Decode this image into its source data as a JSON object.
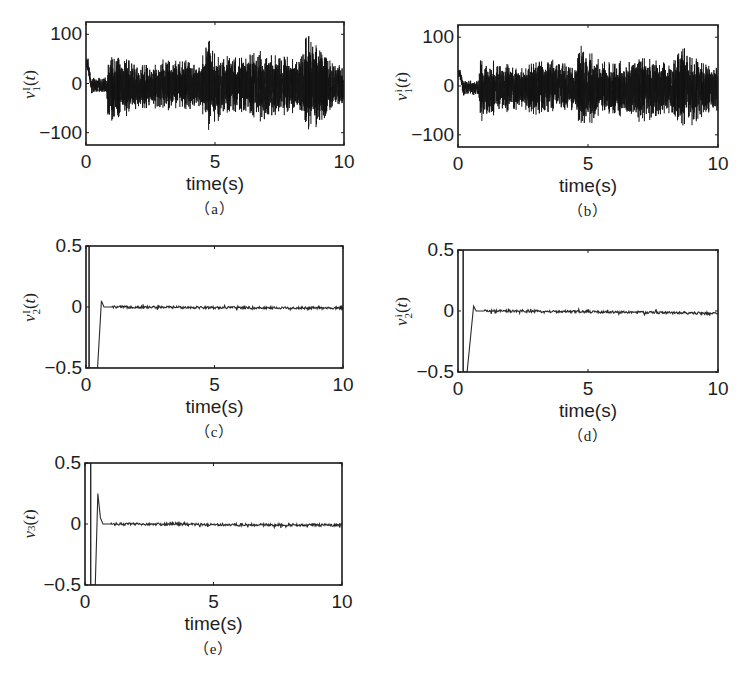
{
  "figure": {
    "panels": [
      {
        "id": "a",
        "caption": "（a）",
        "ylabel_base": "v",
        "ylabel_sup": "I",
        "ylabel_sub": "1",
        "ylabel_tail": "(t)",
        "xlabel": "time(s)",
        "yticks": [
          "100",
          "0",
          "−100"
        ],
        "xticks": [
          "0",
          "5",
          "10"
        ]
      },
      {
        "id": "b",
        "caption": "（b）",
        "ylabel_base": "v",
        "ylabel_sup": "i",
        "ylabel_sub": "1",
        "ylabel_tail": "(t)",
        "xlabel": "time(s)",
        "yticks": [
          "100",
          "0",
          "−100"
        ],
        "xticks": [
          "0",
          "5",
          "10"
        ]
      },
      {
        "id": "c",
        "caption": "（c）",
        "ylabel_base": "v",
        "ylabel_sup": "I",
        "ylabel_sub": "2",
        "ylabel_tail": "(t)",
        "xlabel": "time(s)",
        "yticks": [
          "0.5",
          "0",
          "−0.5"
        ],
        "xticks": [
          "0",
          "5",
          "10"
        ]
      },
      {
        "id": "d",
        "caption": "（d）",
        "ylabel_base": "v",
        "ylabel_sup": "i",
        "ylabel_sub": "2",
        "ylabel_tail": "(t)",
        "xlabel": "time(s)",
        "yticks": [
          "0.5",
          "0",
          "−0.5"
        ],
        "xticks": [
          "0",
          "5",
          "10"
        ]
      },
      {
        "id": "e",
        "caption": "（e）",
        "ylabel_base": "v",
        "ylabel_sup": "",
        "ylabel_sub": "3",
        "ylabel_tail": "(t)",
        "xlabel": "time(s)",
        "yticks": [
          "0.5",
          "0",
          "−0.5"
        ],
        "xticks": [
          "0",
          "5",
          "10"
        ]
      }
    ]
  },
  "chart_data": [
    {
      "panel": "a",
      "type": "line",
      "title": "",
      "xlabel": "time(s)",
      "ylabel": "v1^I(t)",
      "xlim": [
        0,
        10
      ],
      "ylim": [
        -125,
        125
      ],
      "xticks": [
        0,
        5,
        10
      ],
      "yticks": [
        -100,
        0,
        100
      ],
      "grid": false,
      "description": "Dense high-frequency control signal; initial ~50 at t=0, small amplitude (~±15) until t≈0.8, then broadband noise roughly ±50 with spikes to ~+100 near t=4.7 and t=8.6, and ~−95 near t=4.7.",
      "envelope": {
        "t": [
          0,
          0.1,
          0.2,
          0.3,
          0.8,
          0.85,
          1.5,
          2.5,
          3.0,
          3.8,
          4.5,
          4.7,
          5.0,
          5.5,
          6.0,
          6.8,
          7.5,
          8.2,
          8.6,
          9.0,
          9.5,
          10
        ],
        "upper": [
          55,
          50,
          10,
          12,
          12,
          55,
          50,
          35,
          50,
          45,
          48,
          100,
          60,
          55,
          50,
          65,
          60,
          50,
          100,
          70,
          45,
          30
        ],
        "lower": [
          30,
          20,
          -25,
          -20,
          -20,
          -75,
          -65,
          -45,
          -55,
          -50,
          -60,
          -95,
          -80,
          -60,
          -55,
          -75,
          -65,
          -55,
          -90,
          -85,
          -50,
          -40
        ]
      }
    },
    {
      "panel": "b",
      "type": "line",
      "title": "",
      "xlabel": "time(s)",
      "ylabel": "v1^i(t)",
      "xlim": [
        0,
        10
      ],
      "ylim": [
        -125,
        125
      ],
      "xticks": [
        0,
        5,
        10
      ],
      "yticks": [
        -100,
        0,
        100
      ],
      "grid": false,
      "description": "Dense high-frequency control signal similar to (a); initial ~35 at t=0, small amplitude until t≈0.8, then noise roughly ±50 with spikes ~+90 near t=4.8 and ~+80 near t=8.7, min ~−90 near t=4.8.",
      "envelope": {
        "t": [
          0,
          0.1,
          0.2,
          0.3,
          0.8,
          0.85,
          1.5,
          2.5,
          3.0,
          3.8,
          4.5,
          4.8,
          5.2,
          5.5,
          6.0,
          6.8,
          7.5,
          8.2,
          8.7,
          9.0,
          9.5,
          10
        ],
        "upper": [
          35,
          35,
          10,
          12,
          12,
          55,
          50,
          35,
          50,
          55,
          45,
          90,
          60,
          50,
          45,
          60,
          55,
          45,
          80,
          60,
          45,
          45
        ],
        "lower": [
          15,
          10,
          -25,
          -20,
          -20,
          -70,
          -60,
          -45,
          -60,
          -50,
          -55,
          -90,
          -70,
          -55,
          -55,
          -75,
          -70,
          -55,
          -80,
          -80,
          -55,
          -60
        ]
      }
    },
    {
      "panel": "c",
      "type": "line",
      "title": "",
      "xlabel": "time(s)",
      "ylabel": "v2^I(t)",
      "xlim": [
        0,
        10
      ],
      "ylim": [
        -0.5,
        0.5
      ],
      "xticks": [
        0,
        5,
        10
      ],
      "yticks": [
        -0.5,
        0,
        0.5
      ],
      "grid": false,
      "points": [
        [
          0.0,
          0.5
        ],
        [
          0.05,
          0.5
        ],
        [
          0.12,
          0.5
        ],
        [
          0.12,
          -0.5
        ],
        [
          0.45,
          -0.5
        ],
        [
          0.6,
          0.05
        ],
        [
          0.7,
          0.0
        ],
        [
          1.0,
          0.0
        ],
        [
          10,
          -0.01
        ]
      ],
      "noise_amplitude": 0.01
    },
    {
      "panel": "d",
      "type": "line",
      "title": "",
      "xlabel": "time(s)",
      "ylabel": "v2^i(t)",
      "xlim": [
        0,
        10
      ],
      "ylim": [
        -0.5,
        0.5
      ],
      "xticks": [
        0,
        5,
        10
      ],
      "yticks": [
        -0.5,
        0,
        0.5
      ],
      "grid": false,
      "points": [
        [
          0.0,
          0.5
        ],
        [
          0.08,
          0.5
        ],
        [
          0.2,
          0.5
        ],
        [
          0.2,
          -0.5
        ],
        [
          0.35,
          -0.5
        ],
        [
          0.6,
          0.04
        ],
        [
          0.7,
          0.0
        ],
        [
          1.0,
          0.0
        ],
        [
          6.8,
          -0.01
        ],
        [
          10,
          -0.02
        ]
      ],
      "noise_amplitude": 0.01
    },
    {
      "panel": "e",
      "type": "line",
      "title": "",
      "xlabel": "time(s)",
      "ylabel": "v3(t)",
      "xlim": [
        0,
        10
      ],
      "ylim": [
        -0.5,
        0.5
      ],
      "xticks": [
        0,
        5,
        10
      ],
      "yticks": [
        -0.5,
        0,
        0.5
      ],
      "grid": false,
      "points": [
        [
          0.0,
          0.5
        ],
        [
          0.1,
          0.5
        ],
        [
          0.22,
          0.5
        ],
        [
          0.22,
          -0.5
        ],
        [
          0.4,
          -0.5
        ],
        [
          0.5,
          0.25
        ],
        [
          0.6,
          0.05
        ],
        [
          0.7,
          0.0
        ],
        [
          1.0,
          0.0
        ],
        [
          10,
          -0.01
        ]
      ],
      "noise_amplitude": 0.01
    }
  ]
}
